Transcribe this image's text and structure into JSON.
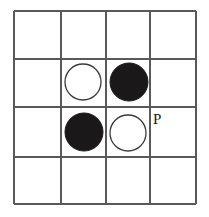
{
  "figure": {
    "name": "go-board-diagram",
    "background_color": "#ffffff",
    "line_color": "#59595b",
    "black_color": "#1a1818",
    "white_fill": "#ffffff",
    "white_outline": "#3a3a3c"
  },
  "board": {
    "rows": 4,
    "cols": 4,
    "left": 14,
    "top": 11,
    "right": 196,
    "bottom": 204,
    "x_lines": [
      14,
      61,
      106,
      150,
      196
    ],
    "y_lines": [
      11,
      59,
      107,
      157,
      204
    ]
  },
  "stones": [
    {
      "id": "stone-white-r2c2",
      "color": "white",
      "row": 2,
      "col": 2,
      "cx": 83,
      "cy": 82,
      "r": 18
    },
    {
      "id": "stone-black-r2c3",
      "color": "black",
      "row": 2,
      "col": 3,
      "cx": 129,
      "cy": 82,
      "r": 19
    },
    {
      "id": "stone-black-r3c2",
      "color": "black",
      "row": 3,
      "col": 2,
      "cx": 84,
      "cy": 132,
      "r": 19
    },
    {
      "id": "stone-white-r3c3",
      "color": "white",
      "row": 3,
      "col": 3,
      "cx": 128,
      "cy": 133,
      "r": 18
    }
  ],
  "labels": [
    {
      "id": "point-label-p",
      "text": "P",
      "row": 3,
      "col": 4,
      "x": 153,
      "y": 124
    }
  ]
}
